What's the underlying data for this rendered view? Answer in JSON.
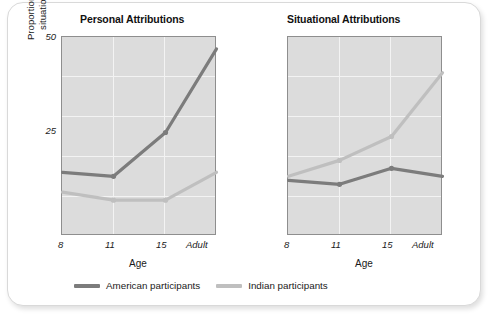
{
  "figure": {
    "y_axis_label_line1": "Proportion of personal and",
    "y_axis_label_line2": "situational attributions",
    "x_axis_label": "Age"
  },
  "legend": {
    "items": [
      {
        "label": "American participants",
        "color": "#7c7c7c",
        "key": "american"
      },
      {
        "label": "Indian participants",
        "color": "#bfbfbf",
        "key": "indian"
      }
    ]
  },
  "panels": [
    {
      "title": "Personal Attributions"
    },
    {
      "title": "Situational Attributions"
    }
  ],
  "chart_data": [
    {
      "type": "line",
      "title": "Personal Attributions",
      "xlabel": "Age",
      "ylabel": "Proportion of personal and situational attributions",
      "categories": [
        "8",
        "11",
        "15",
        "Adult"
      ],
      "ylim": [
        0,
        50
      ],
      "yticks": [
        25,
        50
      ],
      "ytick_labels": [
        "25",
        "50"
      ],
      "gridlines_y": [
        10,
        20,
        30,
        40
      ],
      "gridlines_x": [
        "11",
        "15"
      ],
      "grid": true,
      "legend_position": "bottom",
      "series": [
        {
          "name": "American participants",
          "color": "#7c7c7c",
          "values": [
            16,
            15,
            26,
            47
          ]
        },
        {
          "name": "Indian participants",
          "color": "#bfbfbf",
          "values": [
            11,
            9,
            9,
            16
          ]
        }
      ]
    },
    {
      "type": "line",
      "title": "Situational Attributions",
      "xlabel": "Age",
      "ylabel": "Proportion of personal and situational attributions",
      "categories": [
        "8",
        "11",
        "15",
        "Adult"
      ],
      "ylim": [
        0,
        50
      ],
      "yticks": [
        25,
        50
      ],
      "ytick_labels": [
        "25",
        "50"
      ],
      "gridlines_y": [
        10,
        20,
        30,
        40
      ],
      "gridlines_x": [
        "11",
        "15"
      ],
      "grid": true,
      "legend_position": "bottom",
      "series": [
        {
          "name": "American participants",
          "color": "#7c7c7c",
          "values": [
            14,
            13,
            17,
            15
          ]
        },
        {
          "name": "Indian participants",
          "color": "#bfbfbf",
          "values": [
            15,
            19,
            25,
            41
          ]
        }
      ]
    }
  ],
  "axis_ticks": {
    "left_panel_x": [
      "8",
      "11",
      "15",
      "Adult"
    ],
    "right_panel_x": [
      "8",
      "11",
      "15",
      "Adult"
    ],
    "y_labels": [
      "50",
      "25"
    ]
  }
}
